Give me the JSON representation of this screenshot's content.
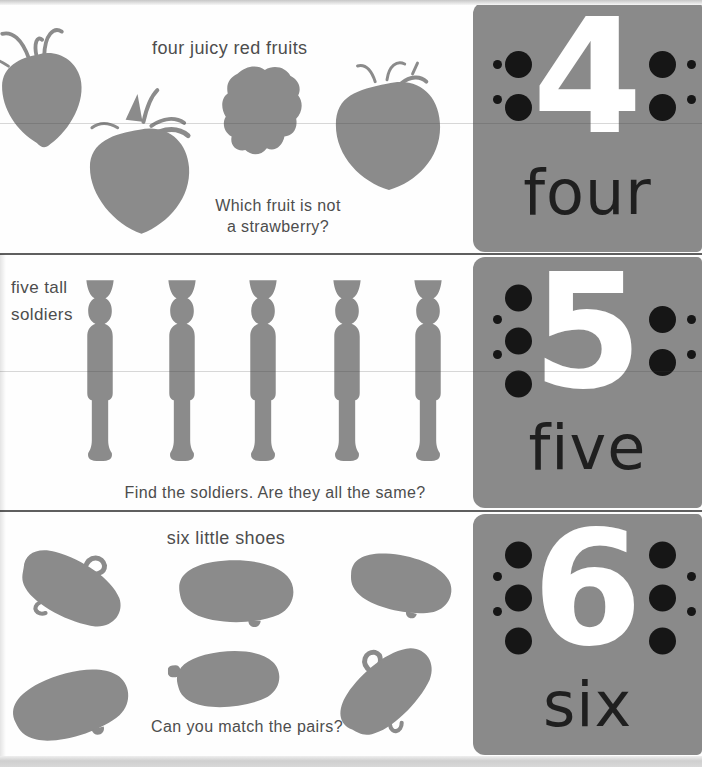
{
  "page_title": "counting board book page: numbers 4, 5, 6",
  "colors": {
    "background": "#fefefe",
    "silhouette": "#8b8b8b",
    "tab_background": "#8a8a8a",
    "caption_text": "#4d4d4d",
    "number_word_text": "#1f1f1f",
    "number_digit": "#ffffff",
    "counting_dot": "#161616"
  },
  "rows": [
    {
      "header": "four juicy red fruits",
      "question_lines": [
        "Which fruit is not",
        "a strawberry?"
      ],
      "number": "4",
      "word": "four",
      "dots_left": 2,
      "dots_right": 2,
      "item_count": 4,
      "items": [
        "strawberry",
        "strawberry",
        "raspberry",
        "strawberry"
      ]
    },
    {
      "header_lines": [
        "five tall",
        "soldiers"
      ],
      "question": "Find the soldiers. Are they all the same?",
      "number": "5",
      "word": "five",
      "dots_left": 3,
      "dots_right": 2,
      "item_count": 5,
      "items": [
        "toy-soldier",
        "toy-soldier",
        "toy-soldier",
        "toy-soldier",
        "toy-soldier"
      ]
    },
    {
      "header": "six little shoes",
      "question": "Can you match the pairs?",
      "number": "6",
      "word": "six",
      "dots_left": 3,
      "dots_right": 3,
      "item_count": 6,
      "items": [
        "shoe",
        "shoe",
        "shoe",
        "shoe",
        "shoe",
        "shoe"
      ]
    }
  ]
}
